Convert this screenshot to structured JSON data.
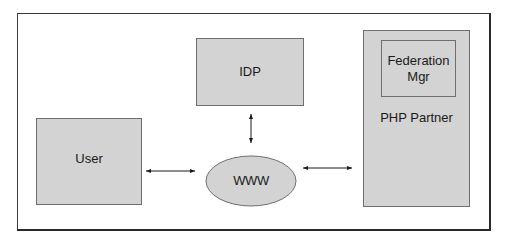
{
  "diagram": {
    "nodes": {
      "idp": {
        "label": "IDP"
      },
      "user": {
        "label": "User"
      },
      "www": {
        "label": "WWW"
      },
      "php_partner": {
        "label": "PHP Partner"
      },
      "federation_mgr": {
        "label_line1": "Federation",
        "label_line2": "Mgr"
      }
    },
    "edges": [
      {
        "from": "User",
        "to": "WWW",
        "type": "bidirectional"
      },
      {
        "from": "IDP",
        "to": "WWW",
        "type": "bidirectional"
      },
      {
        "from": "WWW",
        "to": "PHP Partner",
        "type": "bidirectional"
      }
    ],
    "colors": {
      "box_fill": "#d3d3d3",
      "box_border": "#6e6e6e",
      "frame_border": "#2a2a2a",
      "arrow": "#1a1a1a"
    }
  }
}
